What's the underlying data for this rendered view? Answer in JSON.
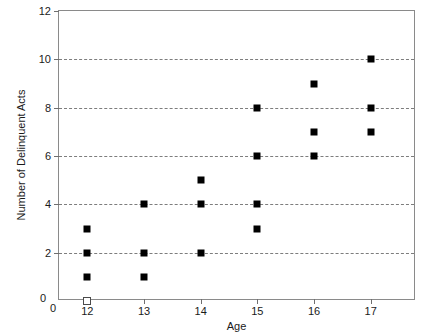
{
  "chart_data": {
    "type": "scatter",
    "title": "",
    "xlabel": "Age",
    "ylabel": "Number of Delinquent Acts",
    "xlim": [
      11.5,
      17.8
    ],
    "ylim": [
      0,
      12
    ],
    "xticks": [
      12,
      13,
      14,
      15,
      16,
      17
    ],
    "yticks": [
      0,
      2,
      4,
      6,
      8,
      10,
      12
    ],
    "xtick_labels": [
      "12",
      "13",
      "14",
      "15",
      "16",
      "17"
    ],
    "ytick_labels": [
      "0",
      "2",
      "4",
      "6",
      "8",
      "10",
      "12"
    ],
    "origin_x_label": "0",
    "origin_y_label": "0",
    "grid": true,
    "gridlines_y": [
      2,
      4,
      6,
      8,
      10
    ],
    "grid_style": "dashed",
    "grid_color": "#7d7d7d",
    "frame": true,
    "frame_color": "#8a8a8a",
    "marker": "square",
    "marker_color": "#000000",
    "legend": "none",
    "points": [
      {
        "x": 12,
        "y": 3,
        "filled": true
      },
      {
        "x": 12,
        "y": 2,
        "filled": true
      },
      {
        "x": 12,
        "y": 1,
        "filled": true
      },
      {
        "x": 12,
        "y": 0,
        "filled": false
      },
      {
        "x": 13,
        "y": 4,
        "filled": true
      },
      {
        "x": 13,
        "y": 2,
        "filled": true
      },
      {
        "x": 13,
        "y": 1,
        "filled": true
      },
      {
        "x": 14,
        "y": 5,
        "filled": true
      },
      {
        "x": 14,
        "y": 4,
        "filled": true
      },
      {
        "x": 14,
        "y": 2,
        "filled": true
      },
      {
        "x": 15,
        "y": 8,
        "filled": true
      },
      {
        "x": 15,
        "y": 6,
        "filled": true
      },
      {
        "x": 15,
        "y": 4,
        "filled": true
      },
      {
        "x": 15,
        "y": 3,
        "filled": true
      },
      {
        "x": 16,
        "y": 9,
        "filled": true
      },
      {
        "x": 16,
        "y": 7,
        "filled": true
      },
      {
        "x": 16,
        "y": 6,
        "filled": true
      },
      {
        "x": 17,
        "y": 10,
        "filled": true
      },
      {
        "x": 17,
        "y": 8,
        "filled": true
      },
      {
        "x": 17,
        "y": 7,
        "filled": true
      }
    ]
  }
}
